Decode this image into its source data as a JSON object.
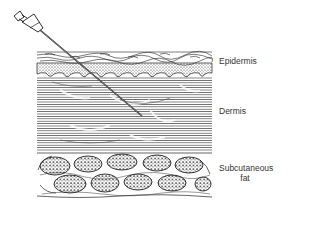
{
  "diagram": {
    "layers": [
      {
        "name": "epidermis",
        "label": "Epidermis"
      },
      {
        "name": "dermis",
        "label": "Dermis"
      },
      {
        "name": "subcutaneous-fat",
        "label_line1": "Subcutaneous",
        "label_line2": "fat"
      }
    ],
    "instrument": "syringe-needle",
    "colors": {
      "ink": "#1a1a1a",
      "background": "#ffffff",
      "label": "#333333"
    }
  }
}
